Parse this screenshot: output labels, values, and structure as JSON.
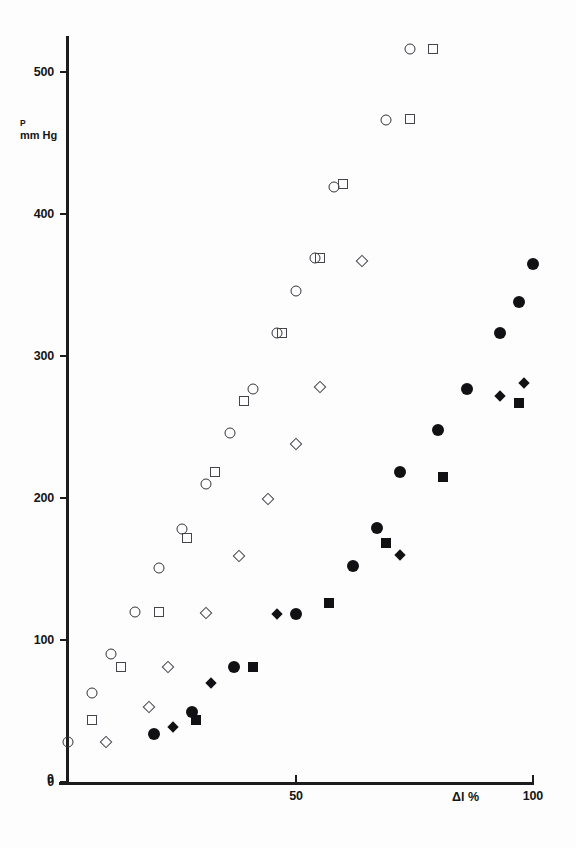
{
  "chart_data": {
    "type": "scatter",
    "title": "",
    "xlabel": "Δl %",
    "ylabel": "P mm Hg",
    "ylabel_symbol": "P",
    "ylabel_unit": "mm Hg",
    "xlim": [
      0,
      105
    ],
    "ylim": [
      0,
      530
    ],
    "xticks": [
      0,
      50,
      100
    ],
    "xtick_labels": [
      "0",
      "50",
      "100"
    ],
    "yticks": [
      0,
      100,
      200,
      300,
      400,
      500
    ],
    "ytick_labels": [
      "0",
      "100",
      "200",
      "300",
      "400",
      "500"
    ],
    "grid": false,
    "legend": "none",
    "series": [
      {
        "name": "open-circle",
        "marker": "open-circle",
        "color": "#33333a",
        "points": [
          [
            2,
            28
          ],
          [
            7,
            63
          ],
          [
            11,
            90
          ],
          [
            16,
            120
          ],
          [
            21,
            151
          ],
          [
            26,
            178
          ],
          [
            31,
            210
          ],
          [
            36,
            246
          ],
          [
            41,
            277
          ],
          [
            46,
            316
          ],
          [
            50,
            346
          ],
          [
            54,
            369
          ],
          [
            58,
            419
          ],
          [
            69,
            466
          ],
          [
            74,
            516
          ]
        ]
      },
      {
        "name": "open-square",
        "marker": "open-square",
        "color": "#44444c",
        "points": [
          [
            7,
            44
          ],
          [
            13,
            81
          ],
          [
            21,
            120
          ],
          [
            27,
            172
          ],
          [
            33,
            218
          ],
          [
            39,
            268
          ],
          [
            47,
            316
          ],
          [
            55,
            369
          ],
          [
            60,
            421
          ],
          [
            74,
            467
          ],
          [
            79,
            516
          ]
        ]
      },
      {
        "name": "open-diamond",
        "marker": "open-diamond",
        "color": "#44444c",
        "points": [
          [
            10,
            28
          ],
          [
            19,
            53
          ],
          [
            23,
            81
          ],
          [
            31,
            119
          ],
          [
            38,
            159
          ],
          [
            44,
            199
          ],
          [
            50,
            238
          ],
          [
            55,
            278
          ],
          [
            64,
            367
          ]
        ]
      },
      {
        "name": "filled-circle",
        "marker": "filled-circle",
        "color": "#111114",
        "points": [
          [
            20,
            34
          ],
          [
            28,
            49
          ],
          [
            37,
            81
          ],
          [
            50,
            118
          ],
          [
            62,
            152
          ],
          [
            67,
            179
          ],
          [
            72,
            218
          ],
          [
            80,
            248
          ],
          [
            86,
            277
          ],
          [
            93,
            316
          ],
          [
            97,
            338
          ],
          [
            100,
            365
          ]
        ]
      },
      {
        "name": "filled-diamond",
        "marker": "filled-diamond",
        "color": "#111114",
        "points": [
          [
            24,
            39
          ],
          [
            32,
            70
          ],
          [
            46,
            118
          ],
          [
            72,
            160
          ],
          [
            93,
            272
          ],
          [
            98,
            281
          ]
        ]
      },
      {
        "name": "filled-square",
        "marker": "filled-square",
        "color": "#111114",
        "points": [
          [
            29,
            44
          ],
          [
            41,
            81
          ],
          [
            57,
            126
          ],
          [
            69,
            168
          ],
          [
            81,
            215
          ],
          [
            97,
            267
          ]
        ]
      }
    ]
  },
  "axes": {
    "y_title_symbol": "P",
    "y_title_unit": "mm Hg",
    "x_title": "Δl %"
  }
}
